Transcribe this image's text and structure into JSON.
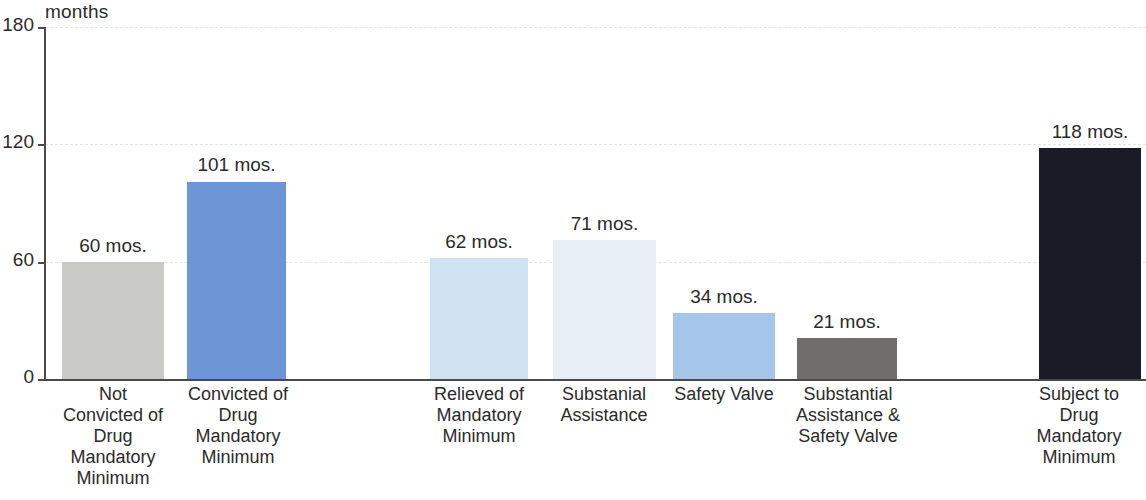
{
  "chart_data": {
    "type": "bar",
    "title": "",
    "subtitle": "",
    "xlabel": "",
    "ylabel": "months",
    "ylim": [
      0,
      180
    ],
    "yticks": [
      0,
      60,
      120,
      180
    ],
    "ytick_labels": [
      "0",
      "60",
      "120",
      "180"
    ],
    "grid": true,
    "grid_style": "dashed-horizontal",
    "legend": "none",
    "value_suffix": " mos.",
    "categories": [
      "Not Convicted of Drug Mandatory Minimum",
      "Convicted of Drug Mandatory Minimum",
      "Relieved of Mandatory Minimum",
      "Substanial Assistance",
      "Safety Valve",
      "Substantial Assistance & Safety Valve",
      "Subject to Drug Mandatory Minimum"
    ],
    "values": [
      60,
      101,
      62,
      71,
      34,
      21,
      118
    ],
    "value_labels": [
      "60 mos.",
      "101 mos.",
      "62 mos.",
      "71 mos.",
      "34 mos.",
      "21 mos.",
      "118 mos."
    ],
    "bar_colors": [
      "#c9c9c6",
      "#6b95d4",
      "#cfe2f2",
      "#e8eef6",
      "#a6c5ea",
      "#6f6e6c",
      "#1b1b27"
    ]
  },
  "axis": {
    "unit_caption": "months",
    "ticks": [
      {
        "label": "180",
        "value": 180
      },
      {
        "label": "120",
        "value": 120
      },
      {
        "label": "60",
        "value": 60
      },
      {
        "label": "0",
        "value": 0
      }
    ]
  },
  "bars": [
    {
      "value_label": "60 mos.",
      "color": "#c9c9c6",
      "label_lines": [
        "Not",
        "Convicted of",
        "Drug",
        "Mandatory",
        "Minimum"
      ]
    },
    {
      "value_label": "101 mos.",
      "color": "#6b95d4",
      "label_lines": [
        "Convicted of",
        "Drug",
        "Mandatory",
        "Minimum"
      ]
    },
    {
      "value_label": "62 mos.",
      "color": "#cfe2f2",
      "label_lines": [
        "Relieved of",
        "Mandatory",
        "Minimum"
      ]
    },
    {
      "value_label": "71 mos.",
      "color": "#e8eef6",
      "label_lines": [
        "Substanial",
        "Assistance"
      ]
    },
    {
      "value_label": "34 mos.",
      "color": "#a6c5ea",
      "label_lines": [
        "Safety Valve"
      ]
    },
    {
      "value_label": "21 mos.",
      "color": "#6f6e6c",
      "label_lines": [
        "Substantial",
        "Assistance &",
        "Safety Valve"
      ]
    },
    {
      "value_label": "118 mos.",
      "color": "#1b1b27",
      "label_lines": [
        "Subject to",
        "Drug",
        "Mandatory",
        "Minimum"
      ]
    }
  ]
}
